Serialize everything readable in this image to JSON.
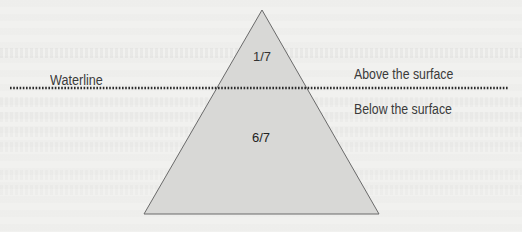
{
  "diagram": {
    "type": "iceberg-triangle",
    "waterline_label": "Waterline",
    "regions": {
      "above": {
        "label": "Above the surface",
        "fraction": "1/7"
      },
      "below": {
        "label": "Below the surface",
        "fraction": "6/7"
      }
    },
    "colors": {
      "triangle_fill": "#d8d8d6",
      "triangle_stroke": "#6a6a6a",
      "waterline": "#2a2a2a",
      "background": "#f1f1ef",
      "text": "#3a3a3a"
    }
  }
}
